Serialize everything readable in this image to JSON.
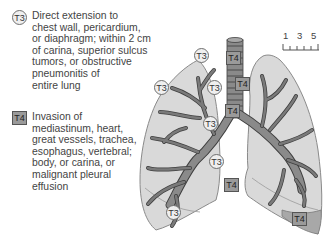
{
  "legend": {
    "t3": {
      "marker_label": "T3",
      "shape": "circle",
      "text": "Direct extension to\nchest wall, pericardium,\nor diaphragm; within 2 cm\nof carina, superior sulcus\ntumors, or obstructive\npneumonitis of\nentire lung"
    },
    "t4": {
      "marker_label": "T4",
      "shape": "square",
      "text": "Invasion of\nmediastinum, heart,\ngreat vessels, trachea,\nesophagus, vertebral;\nbody, or carina, or\nmalignant pleural\neffusion"
    }
  },
  "scale_bar": {
    "labels": [
      "1",
      "3",
      "5"
    ]
  },
  "markers": {
    "t3": [
      {
        "label": "T3",
        "location": "right lung apex"
      },
      {
        "label": "T3",
        "location": "right lung upper lateral chest wall"
      },
      {
        "label": "T3",
        "location": "right lung upper medial"
      },
      {
        "label": "T3",
        "location": "right main bronchus"
      },
      {
        "label": "T3",
        "location": "right lower mediastinal pleura"
      },
      {
        "label": "T3",
        "location": "right lung diaphragm"
      }
    ],
    "t4": [
      {
        "label": "T4",
        "location": "trachea upper"
      },
      {
        "label": "T4",
        "location": "trachea mid"
      },
      {
        "label": "T4",
        "location": "carina"
      },
      {
        "label": "T4",
        "location": "mediastinum"
      },
      {
        "label": "T4",
        "location": "left pleural effusion"
      }
    ]
  },
  "colors": {
    "lung_fill": "#d9d9d9",
    "lung_outline": "#8a8a8a",
    "bronchi": "#7a7a7a",
    "bronchi_outline": "#3f3f3f",
    "t4_fill": "#9a9a9a",
    "effusion_fill": "#a8a8a8",
    "t3_fill": "#efefef"
  }
}
